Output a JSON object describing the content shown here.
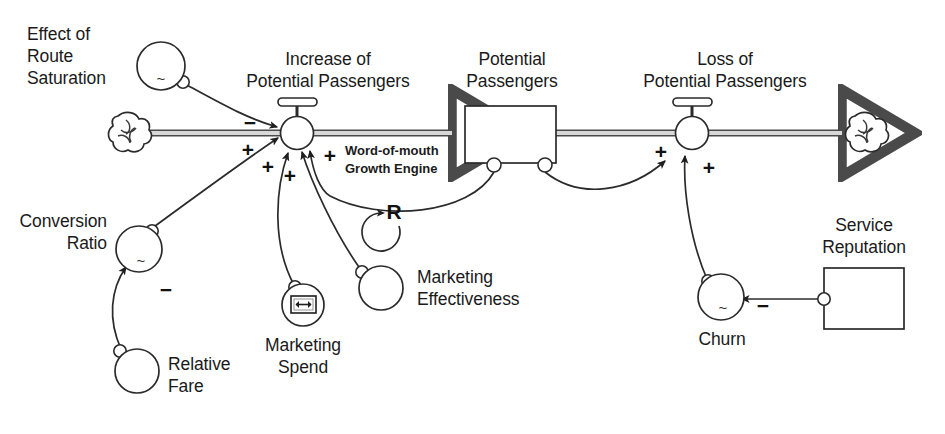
{
  "diagram": {
    "type": "stock-and-flow",
    "background_color": "#ffffff",
    "line_color": "#2b2b2b",
    "pipe_fill_color": "#d8d8d8"
  },
  "stocks": [
    {
      "id": "potential_passengers",
      "label_line1": "Potential",
      "label_line2": "Passengers",
      "shape": "rectangle"
    },
    {
      "id": "service_reputation",
      "label_line1": "Service",
      "label_line2": "Reputation",
      "shape": "rectangle"
    }
  ],
  "flows": [
    {
      "id": "increase_of_potential_passengers",
      "label_line1": "Increase of",
      "label_line2": "Potential Passengers",
      "shape": "valve",
      "source": "cloud-left",
      "target": "potential_passengers"
    },
    {
      "id": "loss_of_potential_passengers",
      "label_line1": "Loss of",
      "label_line2": "Potential Passengers",
      "shape": "valve",
      "source": "potential_passengers",
      "target": "cloud-right"
    }
  ],
  "clouds": [
    {
      "id": "cloud-left",
      "name": "source-cloud"
    },
    {
      "id": "cloud-right",
      "name": "sink-cloud"
    }
  ],
  "variables": [
    {
      "id": "effect_of_route_saturation",
      "label_line1": "Effect of",
      "label_line2": "Route",
      "label_line3": "Saturation",
      "glyph": "~",
      "shape": "circle"
    },
    {
      "id": "conversion_ratio",
      "label_line1": "Conversion",
      "label_line2": "Ratio",
      "glyph": "~",
      "shape": "circle"
    },
    {
      "id": "relative_fare",
      "label_line1": "Relative",
      "label_line2": "Fare",
      "glyph": "",
      "shape": "circle"
    },
    {
      "id": "marketing_spend",
      "label_line1": "Marketing",
      "label_line2": "Spend",
      "glyph": "slider-control-icon",
      "shape": "circle"
    },
    {
      "id": "marketing_effectiveness",
      "label_line1": "Marketing",
      "label_line2": "Effectiveness",
      "glyph": "",
      "shape": "circle"
    },
    {
      "id": "churn",
      "label_line1": "Churn",
      "label_line2": "",
      "glyph": "~",
      "shape": "circle"
    }
  ],
  "loop": {
    "id": "word_of_mouth_loop",
    "caption_line1": "Word-of-mouth",
    "caption_line2": "Growth Engine",
    "letter": "R",
    "polarity_type": "reinforcing"
  },
  "polarities": [
    {
      "id": "p_saturation_to_increase",
      "sign": "−",
      "from": "effect_of_route_saturation",
      "to": "increase_of_potential_passengers"
    },
    {
      "id": "p_conversion_to_increase",
      "sign": "+",
      "from": "conversion_ratio",
      "to": "increase_of_potential_passengers"
    },
    {
      "id": "p_spend_to_increase",
      "sign": "+",
      "from": "marketing_spend",
      "to": "increase_of_potential_passengers"
    },
    {
      "id": "p_effectiveness_to_increase",
      "sign": "+",
      "from": "marketing_effectiveness",
      "to": "increase_of_potential_passengers"
    },
    {
      "id": "p_stock_to_increase",
      "sign": "+",
      "from": "potential_passengers",
      "to": "increase_of_potential_passengers"
    },
    {
      "id": "p_fare_to_conversion",
      "sign": "−",
      "from": "relative_fare",
      "to": "conversion_ratio"
    },
    {
      "id": "p_stock_to_loss",
      "sign": "+",
      "from": "potential_passengers",
      "to": "loss_of_potential_passengers"
    },
    {
      "id": "p_churn_to_loss",
      "sign": "+",
      "from": "churn",
      "to": "loss_of_potential_passengers"
    },
    {
      "id": "p_reputation_to_churn",
      "sign": "−",
      "from": "service_reputation",
      "to": "churn"
    }
  ]
}
